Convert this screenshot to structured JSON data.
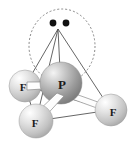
{
  "figure": {
    "name": "pf3-molecular-geometry",
    "background_color": "#ffffff",
    "molecule": "PF3",
    "geometry": "trigonal pyramidal within tetrahedron"
  },
  "atoms": [
    {
      "id": "p-center",
      "label": "P",
      "cx": 61,
      "cy": 83,
      "r": 21,
      "label_x": 62,
      "label_y": 89,
      "font_size": 13,
      "color": "#9a9a9a"
    },
    {
      "id": "f-left",
      "label": "F",
      "cx": 25,
      "cy": 86,
      "r": 16,
      "label_x": 23,
      "label_y": 91,
      "font_size": 11,
      "color": "#c9c9c9"
    },
    {
      "id": "f-bottom",
      "label": "F",
      "cx": 36,
      "cy": 121,
      "r": 17,
      "label_x": 35,
      "label_y": 127,
      "font_size": 11,
      "color": "#c9c9c9"
    },
    {
      "id": "f-right",
      "label": "F",
      "cx": 111,
      "cy": 110,
      "r": 16,
      "label_x": 113,
      "label_y": 116,
      "font_size": 11,
      "color": "#c9c9c9"
    }
  ],
  "lone_pair": {
    "name": "lone-pair-orbital",
    "ellipse": {
      "cx": 62,
      "cy": 46,
      "rx": 33,
      "ry": 37,
      "stroke": "#7a7a7a",
      "dash": "2,2"
    },
    "electrons": [
      {
        "cx": 53,
        "cy": 23,
        "r": 3.4,
        "color": "#111111"
      },
      {
        "cx": 66,
        "cy": 23,
        "r": 3.4,
        "color": "#111111"
      }
    ]
  },
  "tetrahedron": {
    "apex": {
      "x": 58,
      "y": 29
    },
    "edges": [
      {
        "name": "apex-to-f-left",
        "x1": 58,
        "y1": 29,
        "x2": 25,
        "y2": 86
      },
      {
        "name": "apex-to-f-bottom",
        "x1": 58,
        "y1": 29,
        "x2": 36,
        "y2": 121
      },
      {
        "name": "apex-to-f-right",
        "x1": 58,
        "y1": 29,
        "x2": 111,
        "y2": 110
      },
      {
        "name": "f-left-to-f-right-back",
        "x1": 25,
        "y1": 86,
        "x2": 111,
        "y2": 110
      },
      {
        "name": "f-left-to-f-bottom",
        "x1": 25,
        "y1": 86,
        "x2": 36,
        "y2": 121
      },
      {
        "name": "f-bottom-to-f-right",
        "x1": 36,
        "y1": 121,
        "x2": 111,
        "y2": 110
      }
    ],
    "stroke": "#555555",
    "stroke_width": 0.9
  },
  "bonds": [
    {
      "name": "bond-p-to-f-left",
      "points": "56,82 27,83 27,90 58,88",
      "fill": "#fdfdfd",
      "stroke": "#777777"
    },
    {
      "name": "bond-p-to-f-bottom",
      "points": "58,93 34,117 41,120 63,95",
      "fill": "#fdfdfd",
      "stroke": "#777777"
    },
    {
      "name": "bond-p-to-f-right",
      "points": "70,92 109,106 108,112 69,98",
      "fill": "#fdfdfd",
      "stroke": "#777777"
    }
  ]
}
